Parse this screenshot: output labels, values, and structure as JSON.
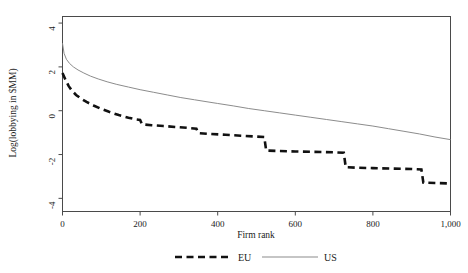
{
  "chart_data": {
    "type": "line",
    "title": "",
    "xlabel": "Firm rank",
    "ylabel": "Log(lobbying in $MM)",
    "xlim": [
      0,
      1000
    ],
    "ylim": [
      -4.6,
      4.3
    ],
    "xticks": [
      0,
      200,
      400,
      600,
      800,
      1000
    ],
    "xticklabels": [
      "0",
      "200",
      "400",
      "600",
      "800",
      "1,000"
    ],
    "yticks": [
      4,
      2,
      0,
      -2,
      -4
    ],
    "yticklabels": [
      "4",
      "2",
      "0",
      "-2",
      "-4"
    ],
    "grid": false,
    "legend_position": "bottom-center",
    "series": [
      {
        "name": "EU",
        "style": "dashed",
        "color": "#111111",
        "x": [
          0,
          8,
          16,
          25,
          35,
          48,
          62,
          80,
          100,
          120,
          145,
          170,
          190,
          200,
          205,
          230,
          260,
          290,
          320,
          345,
          350,
          380,
          420,
          460,
          500,
          520,
          525,
          560,
          600,
          650,
          700,
          725,
          730,
          760,
          800,
          850,
          900,
          925,
          930,
          960,
          1000
        ],
        "y": [
          1.72,
          1.4,
          1.12,
          0.9,
          0.72,
          0.55,
          0.4,
          0.24,
          0.08,
          -0.05,
          -0.2,
          -0.32,
          -0.4,
          -0.42,
          -0.62,
          -0.66,
          -0.7,
          -0.74,
          -0.78,
          -0.82,
          -1.02,
          -1.06,
          -1.1,
          -1.14,
          -1.18,
          -1.2,
          -1.82,
          -1.84,
          -1.86,
          -1.88,
          -1.9,
          -1.92,
          -2.58,
          -2.6,
          -2.62,
          -2.64,
          -2.66,
          -2.68,
          -3.28,
          -3.3,
          -3.32
        ]
      },
      {
        "name": "US",
        "style": "solid",
        "color": "#8c8c8c",
        "x": [
          0,
          4,
          10,
          18,
          28,
          40,
          55,
          72,
          92,
          115,
          140,
          170,
          200,
          235,
          270,
          305,
          340,
          375,
          400,
          440,
          480,
          520,
          560,
          600,
          640,
          680,
          720,
          760,
          800,
          840,
          880,
          920,
          960,
          1000
        ],
        "y": [
          3.08,
          2.62,
          2.35,
          2.16,
          2.0,
          1.86,
          1.72,
          1.58,
          1.45,
          1.32,
          1.2,
          1.08,
          0.96,
          0.84,
          0.72,
          0.6,
          0.5,
          0.4,
          0.33,
          0.22,
          0.1,
          0.0,
          -0.1,
          -0.2,
          -0.3,
          -0.4,
          -0.5,
          -0.6,
          -0.7,
          -0.82,
          -0.94,
          -1.06,
          -1.2,
          -1.32
        ]
      }
    ],
    "legend": [
      {
        "label": "EU",
        "style": "dashed",
        "color": "#111111"
      },
      {
        "label": "US",
        "style": "solid",
        "color": "#8c8c8c"
      }
    ]
  }
}
